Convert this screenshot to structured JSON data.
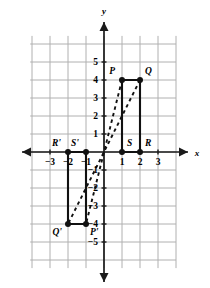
{
  "figure": {
    "type": "coordinate-plane-transformation",
    "axis_labels": {
      "x": "x",
      "y": "y"
    },
    "grid": {
      "visible": true,
      "x_min": -4,
      "x_max": 4,
      "y_min": -6,
      "y_max": 6,
      "cell_size_units": 1
    },
    "x_ticks": [
      "-3",
      "-2",
      "-1",
      "1",
      "2",
      "3"
    ],
    "x_tick_values": [
      -3,
      -2,
      -1,
      1,
      2,
      3
    ],
    "y_ticks": [
      "5",
      "4",
      "3",
      "2",
      "1",
      "-1",
      "-2",
      "-3",
      "-4",
      "-5"
    ],
    "y_tick_values": [
      5,
      4,
      3,
      2,
      1,
      -1,
      -2,
      -3,
      -4,
      -5
    ],
    "colors": {
      "grid": "#b0b0b0",
      "axis": "#1a1a1a",
      "shape": "#111111",
      "dashed": "#111111",
      "text": "#000000",
      "background": "#ffffff"
    },
    "preimage": {
      "name": "PQRS",
      "vertices": [
        {
          "label": "P",
          "x": 1,
          "y": 4,
          "label_pos": "above-left"
        },
        {
          "label": "Q",
          "x": 2,
          "y": 4,
          "label_pos": "above-right"
        },
        {
          "label": "R",
          "x": 2,
          "y": 0,
          "label_pos": "above-right"
        },
        {
          "label": "S",
          "x": 1,
          "y": 0,
          "label_pos": "above-right"
        }
      ]
    },
    "image": {
      "name": "P'Q'R'S'",
      "vertices": [
        {
          "label": "P'",
          "x": -1,
          "y": -4,
          "label_pos": "below-right"
        },
        {
          "label": "Q'",
          "x": -2,
          "y": -4,
          "label_pos": "below-left"
        },
        {
          "label": "R'",
          "x": -2,
          "y": 0,
          "label_pos": "above-left"
        },
        {
          "label": "S'",
          "x": -1,
          "y": 0,
          "label_pos": "above-left"
        }
      ]
    },
    "dashed_connectors": [
      {
        "from": {
          "x": 1,
          "y": 4
        },
        "to": {
          "x": -1,
          "y": -4
        },
        "name": "P-to-P-prime"
      },
      {
        "from": {
          "x": 2,
          "y": 4
        },
        "to": {
          "x": -2,
          "y": -4
        },
        "name": "Q-to-Q-prime"
      }
    ]
  }
}
